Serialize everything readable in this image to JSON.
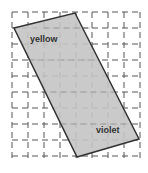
{
  "diagram": {
    "shape_color": "#c4c4c4",
    "outline_color": "#333333",
    "grid_color": "#555555",
    "labels": {
      "top": "yellow",
      "bottom": "violet"
    },
    "grid": {
      "x0": 12,
      "y0": 12,
      "cols": 8,
      "rows": 9,
      "cell": 16
    },
    "vertices": [
      [
        14,
        28
      ],
      [
        75,
        13
      ],
      [
        139,
        139
      ],
      [
        77,
        157
      ]
    ]
  }
}
